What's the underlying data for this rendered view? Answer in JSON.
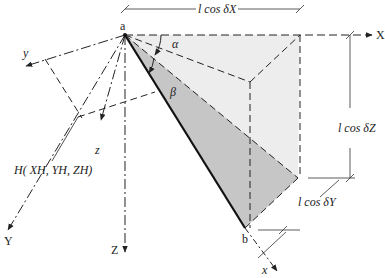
{
  "points": {
    "a": "a",
    "b": "b"
  },
  "axes": {
    "X": "X",
    "Y": "Y",
    "Z": "Z",
    "x": "x",
    "y": "y",
    "z": "z"
  },
  "angles": {
    "alpha": "α",
    "beta": "β"
  },
  "dimensions": {
    "lx": "l cos δX",
    "lz": "l cos δZ",
    "ly": "l cos δY"
  },
  "point_H": "H( XH, YH, ZH)",
  "colors": {
    "light_fill": "#eeeeee",
    "dark_fill": "#c8c8c8",
    "line": "#222222"
  }
}
